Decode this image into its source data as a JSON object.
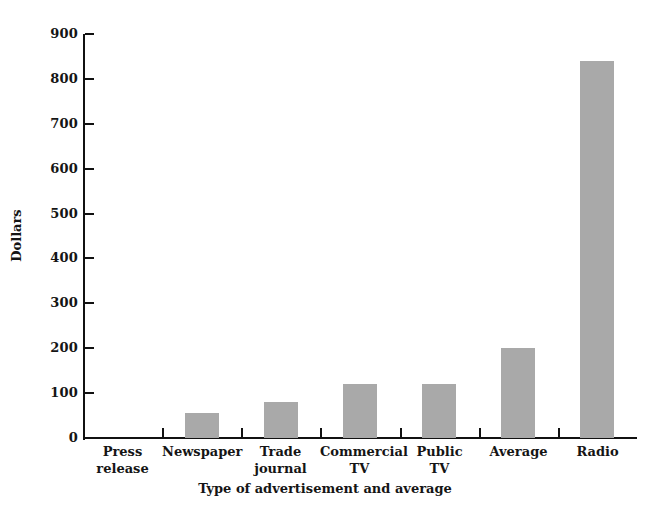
{
  "chart_data": {
    "type": "bar",
    "title": "",
    "xlabel": "Type of advertisement and average",
    "ylabel": "Dollars",
    "ylim": [
      0,
      900
    ],
    "ytick_values": [
      0,
      100,
      200,
      300,
      400,
      500,
      600,
      700,
      800,
      900
    ],
    "ytick_labels": [
      "0",
      "100",
      "200",
      "300",
      "400",
      "500",
      "600",
      "700",
      "800",
      "900"
    ],
    "grid": false,
    "legend": "none",
    "bar_color": "#a9a9a9",
    "axis_color": "#111111",
    "background": "#ffffff",
    "categories": [
      "Press release",
      "Newspaper",
      "Trade journal",
      "Commercial TV",
      "Public TV",
      "Average",
      "Radio"
    ],
    "category_lines": [
      [
        "Press",
        "release"
      ],
      [
        "Newspaper",
        ""
      ],
      [
        "Trade",
        "journal"
      ],
      [
        "Commercial",
        "TV"
      ],
      [
        "Public",
        "TV"
      ],
      [
        "Average",
        ""
      ],
      [
        "Radio",
        ""
      ]
    ],
    "values": [
      0,
      55,
      80,
      120,
      120,
      200,
      840
    ]
  }
}
